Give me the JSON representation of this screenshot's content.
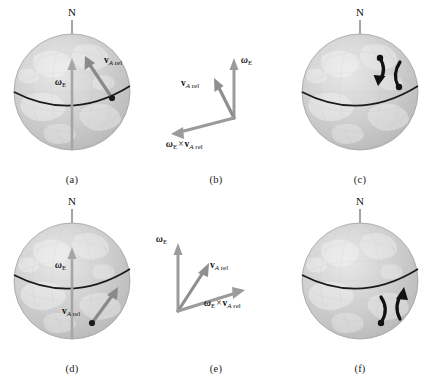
{
  "figure": {
    "background_color": "#ffffff",
    "globe_color": "#c9c9c9",
    "equator_color": "#1a1a1a",
    "vector_color": "#8c8c8c",
    "axis_color": "#9a9a9a",
    "deflection_arrow_color": "#111111"
  },
  "labels": {
    "north_pole": "N",
    "omega_symbol": "ω",
    "omega_sub": "E",
    "v_symbol": "v",
    "v_sub_italic": "A",
    "v_sub_rel": " rel",
    "cross_symbol": "×"
  },
  "panels": [
    {
      "id": "a",
      "caption": "(a)",
      "kind": "globe",
      "pole_label": "N",
      "omega_label": "ωE",
      "velocity_label": "vA rel",
      "hemisphere": "northern",
      "velocity_direction": "up-right",
      "show_velocity": true,
      "show_deflection": false
    },
    {
      "id": "b",
      "caption": "(b)",
      "kind": "vectors",
      "hemisphere": "northern",
      "vectors": [
        {
          "name": "omega_E",
          "label": "ωE",
          "direction": "up"
        },
        {
          "name": "v_A_rel",
          "label": "vA rel",
          "direction": "up-left"
        },
        {
          "name": "omega_cross_v",
          "label": "ωE × vA rel",
          "direction": "down-left"
        }
      ]
    },
    {
      "id": "c",
      "caption": "(c)",
      "kind": "globe",
      "pole_label": "N",
      "hemisphere": "northern",
      "deflection": "right",
      "show_velocity": false,
      "show_deflection": true
    },
    {
      "id": "d",
      "caption": "(d)",
      "kind": "globe",
      "pole_label": "N",
      "omega_label": "ωE",
      "velocity_label": "vA rel",
      "hemisphere": "southern",
      "velocity_direction": "up-right",
      "show_velocity": true,
      "show_deflection": false
    },
    {
      "id": "e",
      "caption": "(e)",
      "kind": "vectors",
      "hemisphere": "southern",
      "vectors": [
        {
          "name": "omega_E",
          "label": "ωE",
          "direction": "up"
        },
        {
          "name": "v_A_rel",
          "label": "vA rel",
          "direction": "up-right"
        },
        {
          "name": "omega_cross_v",
          "label": "ωE × vA rel",
          "direction": "right"
        }
      ]
    },
    {
      "id": "f",
      "caption": "(f)",
      "kind": "globe",
      "pole_label": "N",
      "hemisphere": "southern",
      "deflection": "left",
      "show_velocity": false,
      "show_deflection": true
    }
  ]
}
